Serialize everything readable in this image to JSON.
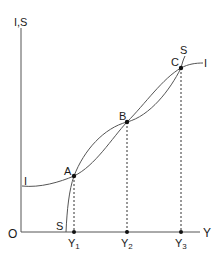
{
  "diagram": {
    "axes": {
      "y_label": "I,S",
      "x_label": "Y",
      "origin_label": "O"
    },
    "curves": [
      {
        "name": "I",
        "label_left": "I",
        "label_right": "I"
      },
      {
        "name": "S",
        "label_bottom": "S",
        "label_top": "S"
      }
    ],
    "points": [
      {
        "label": "A",
        "x": 74,
        "y": 176
      },
      {
        "label": "B",
        "x": 127,
        "y": 122
      },
      {
        "label": "C",
        "x": 181,
        "y": 68
      }
    ],
    "x_ticks": [
      {
        "label": "Y",
        "sub": "1",
        "x": 74
      },
      {
        "label": "Y",
        "sub": "2",
        "x": 127
      },
      {
        "label": "Y",
        "sub": "3",
        "x": 181
      }
    ],
    "colors": {
      "line": "#555555",
      "text": "#1a1a1a",
      "point": "#111111"
    }
  }
}
